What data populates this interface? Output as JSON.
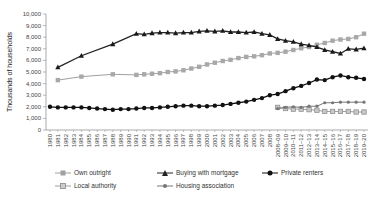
{
  "chart_data": {
    "type": "line",
    "title": "",
    "xlabel": "",
    "ylabel": "Thousands of households",
    "ylim": [
      0,
      10000
    ],
    "yticks": [
      0,
      1000,
      2000,
      3000,
      4000,
      5000,
      6000,
      7000,
      8000,
      9000,
      10000
    ],
    "ytick_labels": [
      "0",
      "1,000",
      "2,000",
      "3,000",
      "4,000",
      "5,000",
      "6,000",
      "7,000",
      "8,000",
      "9,000",
      "10,000"
    ],
    "grid": false,
    "legend_position": "bottom",
    "categories": [
      "1980",
      "1981",
      "1982",
      "1983",
      "1984",
      "1985",
      "1986",
      "1987",
      "1988",
      "1989",
      "1990",
      "1991",
      "1992",
      "1993",
      "1994",
      "1995",
      "1996",
      "1997",
      "1998",
      "1999",
      "2000",
      "2001",
      "2002",
      "2003",
      "2004",
      "2005",
      "2006",
      "2007",
      "2008",
      "2008–09",
      "2009–10",
      "2010–11",
      "2011–12",
      "2012–13",
      "2013–14",
      "2014–15",
      "2015–16",
      "2016–17",
      "2017–18",
      "2018–19",
      "2019–20"
    ],
    "series": [
      {
        "name": "Own outright",
        "color": "#a0a0a0",
        "marker": "square",
        "values": [
          null,
          4300,
          null,
          null,
          4600,
          null,
          null,
          null,
          4800,
          null,
          null,
          4750,
          4800,
          4850,
          4900,
          5000,
          5050,
          5150,
          5300,
          5450,
          5650,
          5800,
          5950,
          6050,
          6200,
          6300,
          6350,
          6450,
          6600,
          6650,
          6750,
          6900,
          7050,
          7150,
          7350,
          7500,
          7700,
          7800,
          7850,
          8000,
          8300
        ]
      },
      {
        "name": "Buying with mortgage",
        "color": "#222222",
        "marker": "triangle",
        "values": [
          null,
          5400,
          null,
          null,
          6400,
          null,
          null,
          null,
          7400,
          null,
          null,
          8300,
          8250,
          8350,
          8400,
          8400,
          8350,
          8400,
          8400,
          8500,
          8550,
          8500,
          8550,
          8450,
          8450,
          8400,
          8450,
          8300,
          8200,
          7850,
          7700,
          7600,
          7400,
          7300,
          7150,
          6900,
          6750,
          6600,
          7000,
          6950,
          7050
        ]
      },
      {
        "name": "Private renters",
        "color": "#111111",
        "marker": "circle",
        "values": [
          2000,
          1950,
          1950,
          1950,
          1950,
          1900,
          1850,
          1800,
          1750,
          1800,
          1800,
          1850,
          1900,
          1900,
          1950,
          2000,
          2050,
          2100,
          2100,
          2050,
          2050,
          2100,
          2150,
          2250,
          2350,
          2450,
          2600,
          2750,
          3000,
          3100,
          3350,
          3600,
          3800,
          4050,
          4350,
          4300,
          4550,
          4700,
          4550,
          4500,
          4400
        ]
      },
      {
        "name": "Local authority",
        "color": "#a0a0a0",
        "marker": "open-square",
        "values": [
          null,
          null,
          null,
          null,
          null,
          null,
          null,
          null,
          null,
          null,
          null,
          null,
          null,
          null,
          null,
          null,
          null,
          null,
          null,
          null,
          null,
          null,
          null,
          null,
          null,
          null,
          null,
          null,
          null,
          1950,
          1850,
          1800,
          1800,
          1750,
          1700,
          1600,
          1600,
          1600,
          1600,
          1550,
          1550
        ]
      },
      {
        "name": "Housing association",
        "color": "#777777",
        "marker": "diamond",
        "values": [
          null,
          null,
          null,
          null,
          null,
          null,
          null,
          null,
          null,
          null,
          null,
          null,
          null,
          null,
          null,
          null,
          null,
          null,
          null,
          null,
          null,
          null,
          null,
          null,
          null,
          null,
          null,
          null,
          null,
          1850,
          1950,
          2000,
          1950,
          2050,
          2050,
          2350,
          2350,
          2400,
          2400,
          2400,
          2400
        ]
      }
    ]
  },
  "legend": {
    "own_outright": "Own outright",
    "buying_with_mortgage": "Buying with mortgage",
    "private_renters": "Private renters",
    "local_authority": "Local authority",
    "housing_association": "Housing association"
  }
}
